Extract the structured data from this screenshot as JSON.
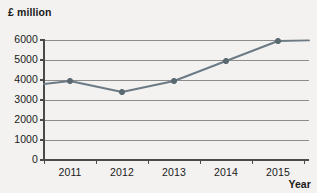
{
  "chart_data": {
    "type": "line",
    "title": "",
    "subtitle": "",
    "ylabel": "£ million",
    "xlabel": "Year",
    "categories": [
      "2011",
      "2012",
      "2013",
      "2014",
      "2015"
    ],
    "x": [
      2011,
      2012,
      2013,
      2014,
      2015
    ],
    "values": [
      3950,
      3400,
      3950,
      4950,
      5950
    ],
    "series": [
      {
        "name": "",
        "values": [
          3950,
          3400,
          3950,
          4950,
          5950
        ]
      }
    ],
    "ylim": [
      0,
      6000
    ],
    "yticks": [
      0,
      1000,
      2000,
      3000,
      4000,
      5000,
      6000
    ],
    "ytick_labels": [
      "0",
      "1000",
      "2000",
      "3000",
      "4000",
      "5000",
      "6000"
    ],
    "xtick_labels": [
      "2011",
      "2012",
      "2013",
      "2014",
      "2015"
    ],
    "grid": true,
    "grid_axis": "y",
    "legend": false,
    "legend_position": "none",
    "marker": "circle",
    "line_extends_to_edges": true,
    "left_edge_value": 3800,
    "right_edge_value": 5980,
    "annotations": []
  },
  "style": {
    "line_color": "#6b7a85",
    "marker_color": "#5a6870",
    "grid_color": "#8c8c8c",
    "axis_color": "#4a4a4a",
    "text_color": "#1a1a1a",
    "background": "#f3f2f0"
  }
}
